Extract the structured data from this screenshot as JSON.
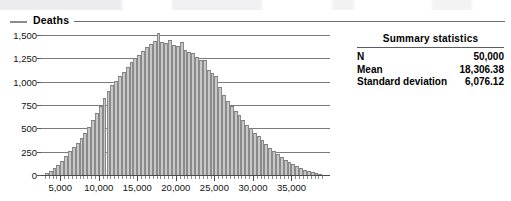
{
  "legend": {
    "label": "Deaths",
    "swatch_color": "#8b8b8b"
  },
  "summary": {
    "title": "Summary statistics",
    "rows": [
      {
        "label": "N",
        "value": "50,000"
      },
      {
        "label": "Mean",
        "value": "18,306.38"
      },
      {
        "label": "Standard deviation",
        "value": "6,076.12"
      }
    ]
  },
  "chart_data": {
    "type": "bar",
    "title": "Deaths",
    "xlabel": "",
    "ylabel": "",
    "grid": true,
    "legend_position": "top-left",
    "bar_color": "#c8c8c8",
    "bar_edge_color": "#8a8a8a",
    "xlim": [
      2500,
      40000
    ],
    "ylim": [
      0,
      1500
    ],
    "ytick_labels": [
      "1,500",
      "1,250",
      "1,000",
      "750",
      "500",
      "250",
      "0"
    ],
    "ytick_values": [
      1500,
      1250,
      1000,
      750,
      500,
      250,
      0
    ],
    "xtick_labels": [
      "5,000",
      "10,000",
      "15,000",
      "20,000",
      "25,000",
      "30,000",
      "35,000"
    ],
    "xtick_values": [
      5000,
      10000,
      15000,
      20000,
      25000,
      30000,
      35000
    ],
    "bin_width": 500,
    "x": [
      3250,
      3750,
      4250,
      4750,
      5250,
      5750,
      6250,
      6750,
      7250,
      7750,
      8250,
      8750,
      9250,
      9750,
      10250,
      10750,
      11250,
      11750,
      12250,
      12750,
      13250,
      13750,
      14250,
      14750,
      15250,
      15750,
      16250,
      16750,
      17250,
      17750,
      18250,
      18750,
      19250,
      19750,
      20250,
      20750,
      21250,
      21750,
      22250,
      22750,
      23250,
      23750,
      24250,
      24750,
      25250,
      25750,
      26250,
      26750,
      27250,
      27750,
      28250,
      28750,
      29250,
      29750,
      30250,
      30750,
      31250,
      31750,
      32250,
      32750,
      33250,
      33750,
      34250,
      34750,
      35250,
      35750,
      36250,
      36750,
      37250,
      37750,
      38250,
      38750
    ],
    "values": [
      25,
      45,
      75,
      110,
      150,
      200,
      255,
      300,
      345,
      395,
      450,
      515,
      585,
      660,
      740,
      820,
      900,
      960,
      1010,
      1060,
      1105,
      1155,
      1210,
      1250,
      1285,
      1325,
      1375,
      1400,
      1435,
      1520,
      1420,
      1415,
      1450,
      1395,
      1385,
      1420,
      1340,
      1320,
      1310,
      1260,
      1230,
      1235,
      1120,
      1090,
      1060,
      940,
      860,
      790,
      740,
      690,
      640,
      590,
      540,
      500,
      455,
      415,
      375,
      330,
      290,
      255,
      225,
      195,
      165,
      140,
      115,
      95,
      75,
      58,
      45,
      32,
      20,
      12
    ]
  }
}
